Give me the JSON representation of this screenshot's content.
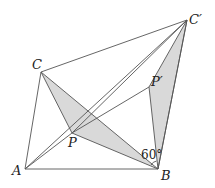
{
  "diagram": {
    "title": "",
    "points": {
      "A": {
        "label": "A",
        "x": 25,
        "y": 169
      },
      "B": {
        "label": "B",
        "x": 158,
        "y": 169
      },
      "C": {
        "label": "C",
        "x": 41,
        "y": 72
      },
      "C1": {
        "label": "C′",
        "x": 187,
        "y": 20
      },
      "P": {
        "label": "P",
        "x": 72,
        "y": 133
      },
      "P1": {
        "label": "P′",
        "x": 149,
        "y": 87
      }
    },
    "angle_label": "60°",
    "colors": {
      "shade": "#d9d9d9",
      "line": "#555555"
    }
  }
}
